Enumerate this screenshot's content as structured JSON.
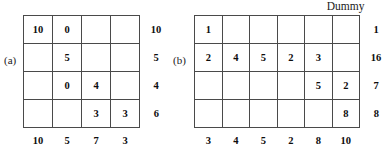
{
  "figure": {
    "panels": [
      {
        "id": "a",
        "caption": "(a)",
        "dummy_header": "",
        "columns": 4,
        "rows": 4,
        "cells": [
          [
            "10",
            "0",
            "",
            ""
          ],
          [
            "",
            "5",
            "",
            ""
          ],
          [
            "",
            "0",
            "4",
            ""
          ],
          [
            "",
            "",
            "3",
            "3"
          ]
        ],
        "row_labels": [
          "10",
          "5",
          "4",
          "6"
        ],
        "col_labels": [
          "10",
          "5",
          "7",
          "3"
        ]
      },
      {
        "id": "b",
        "caption": "(b)",
        "dummy_header": "Dummy",
        "columns": 6,
        "rows": 4,
        "cells": [
          [
            "1",
            "",
            "",
            "",
            "",
            ""
          ],
          [
            "2",
            "4",
            "5",
            "2",
            "3",
            ""
          ],
          [
            "",
            "",
            "",
            "",
            "5",
            "2"
          ],
          [
            "",
            "",
            "",
            "",
            "",
            "8"
          ]
        ],
        "row_labels": [
          "1",
          "16",
          "7",
          "8"
        ],
        "col_labels": [
          "3",
          "4",
          "5",
          "2",
          "8",
          "10"
        ]
      }
    ],
    "colors": {
      "background": "#ffffff",
      "grid_line": "#4a4a4a",
      "text": "#0d0d0d"
    }
  }
}
